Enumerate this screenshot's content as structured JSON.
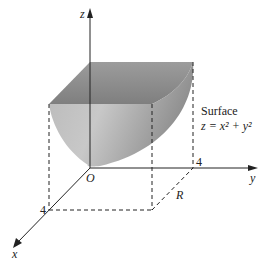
{
  "figure": {
    "axes": {
      "z_label": "z",
      "y_label": "y",
      "x_label": "x",
      "origin_label": "O"
    },
    "ticks": {
      "x_tick": "4",
      "y_tick": "4"
    },
    "region_label": "R",
    "surface": {
      "label": "Surface",
      "equation": "z = x² + y²"
    },
    "colors": {
      "surface_light": "#d8d8d8",
      "surface_dark": "#8a8a8a",
      "lines": "#222222"
    }
  }
}
